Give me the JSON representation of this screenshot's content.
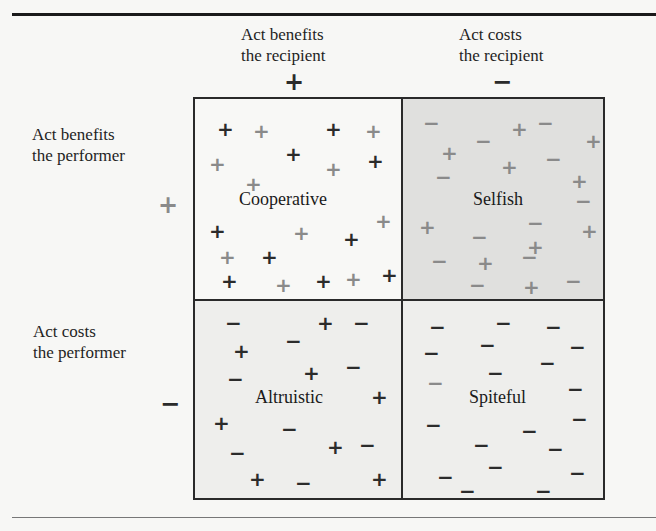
{
  "top_cut_glyph": "p",
  "column_headers": [
    {
      "line1": "Act benefits",
      "line2": "the recipient",
      "sign": "+"
    },
    {
      "line1": "Act costs",
      "line2": "the recipient",
      "sign": "−"
    }
  ],
  "row_headers": [
    {
      "line1": "Act benefits",
      "line2": "the performer",
      "sign": "+"
    },
    {
      "line1": "Act costs",
      "line2": "the performer",
      "sign": "−"
    }
  ],
  "quadrants": {
    "cooperative": {
      "label": "Cooperative",
      "background": "#f8f8f6"
    },
    "selfish": {
      "label": "Selfish",
      "background": "#e0e0de"
    },
    "altruistic": {
      "label": "Altruistic",
      "background": "#eeeeec"
    },
    "spiteful": {
      "label": "Spiteful",
      "background": "#eeeeec"
    }
  },
  "marks": {
    "cooperative": [
      {
        "s": "+",
        "x": 22,
        "y": 20,
        "c": "dark"
      },
      {
        "s": "+",
        "x": 58,
        "y": 22,
        "c": "gray"
      },
      {
        "s": "+",
        "x": 130,
        "y": 20,
        "c": "dark"
      },
      {
        "s": "+",
        "x": 170,
        "y": 22,
        "c": "gray"
      },
      {
        "s": "+",
        "x": 14,
        "y": 55,
        "c": "gray"
      },
      {
        "s": "+",
        "x": 90,
        "y": 45,
        "c": "dark"
      },
      {
        "s": "+",
        "x": 130,
        "y": 60,
        "c": "gray"
      },
      {
        "s": "+",
        "x": 172,
        "y": 52,
        "c": "dark"
      },
      {
        "s": "+",
        "x": 50,
        "y": 75,
        "c": "gray"
      },
      {
        "s": "+",
        "x": 14,
        "y": 122,
        "c": "dark"
      },
      {
        "s": "+",
        "x": 98,
        "y": 124,
        "c": "gray"
      },
      {
        "s": "+",
        "x": 148,
        "y": 130,
        "c": "dark"
      },
      {
        "s": "+",
        "x": 180,
        "y": 112,
        "c": "gray"
      },
      {
        "s": "+",
        "x": 24,
        "y": 148,
        "c": "gray"
      },
      {
        "s": "+",
        "x": 66,
        "y": 148,
        "c": "dark"
      },
      {
        "s": "+",
        "x": 26,
        "y": 172,
        "c": "dark"
      },
      {
        "s": "+",
        "x": 80,
        "y": 176,
        "c": "gray"
      },
      {
        "s": "+",
        "x": 120,
        "y": 172,
        "c": "dark"
      },
      {
        "s": "+",
        "x": 150,
        "y": 170,
        "c": "gray"
      },
      {
        "s": "+",
        "x": 186,
        "y": 166,
        "c": "dark"
      }
    ],
    "selfish": [
      {
        "s": "−",
        "x": 20,
        "y": 14,
        "c": "gray"
      },
      {
        "s": "+",
        "x": 108,
        "y": 20,
        "c": "gray"
      },
      {
        "s": "−",
        "x": 134,
        "y": 14,
        "c": "gray"
      },
      {
        "s": "+",
        "x": 182,
        "y": 32,
        "c": "gray"
      },
      {
        "s": "+",
        "x": 38,
        "y": 44,
        "c": "gray"
      },
      {
        "s": "−",
        "x": 72,
        "y": 32,
        "c": "gray"
      },
      {
        "s": "−",
        "x": 142,
        "y": 50,
        "c": "gray"
      },
      {
        "s": "+",
        "x": 98,
        "y": 58,
        "c": "gray"
      },
      {
        "s": "−",
        "x": 32,
        "y": 68,
        "c": "gray"
      },
      {
        "s": "+",
        "x": 168,
        "y": 72,
        "c": "gray"
      },
      {
        "s": "−",
        "x": 172,
        "y": 92,
        "c": "gray"
      },
      {
        "s": "+",
        "x": 16,
        "y": 118,
        "c": "gray"
      },
      {
        "s": "−",
        "x": 124,
        "y": 114,
        "c": "gray"
      },
      {
        "s": "−",
        "x": 68,
        "y": 128,
        "c": "gray"
      },
      {
        "s": "+",
        "x": 178,
        "y": 122,
        "c": "gray"
      },
      {
        "s": "+",
        "x": 124,
        "y": 138,
        "c": "gray"
      },
      {
        "s": "−",
        "x": 28,
        "y": 152,
        "c": "gray"
      },
      {
        "s": "+",
        "x": 74,
        "y": 154,
        "c": "gray"
      },
      {
        "s": "−",
        "x": 118,
        "y": 148,
        "c": "gray"
      },
      {
        "s": "−",
        "x": 66,
        "y": 176,
        "c": "gray"
      },
      {
        "s": "+",
        "x": 120,
        "y": 178,
        "c": "gray"
      },
      {
        "s": "−",
        "x": 162,
        "y": 172,
        "c": "gray"
      }
    ],
    "altruistic": [
      {
        "s": "−",
        "x": 30,
        "y": 12,
        "c": "dark"
      },
      {
        "s": "+",
        "x": 122,
        "y": 12,
        "c": "dark"
      },
      {
        "s": "−",
        "x": 158,
        "y": 12,
        "c": "dark"
      },
      {
        "s": "+",
        "x": 38,
        "y": 40,
        "c": "dark"
      },
      {
        "s": "−",
        "x": 90,
        "y": 30,
        "c": "dark"
      },
      {
        "s": "−",
        "x": 32,
        "y": 68,
        "c": "dark"
      },
      {
        "s": "+",
        "x": 108,
        "y": 62,
        "c": "dark"
      },
      {
        "s": "−",
        "x": 150,
        "y": 56,
        "c": "dark"
      },
      {
        "s": "+",
        "x": 176,
        "y": 86,
        "c": "dark"
      },
      {
        "s": "+",
        "x": 18,
        "y": 112,
        "c": "dark"
      },
      {
        "s": "−",
        "x": 86,
        "y": 118,
        "c": "dark"
      },
      {
        "s": "−",
        "x": 34,
        "y": 142,
        "c": "dark"
      },
      {
        "s": "+",
        "x": 132,
        "y": 136,
        "c": "dark"
      },
      {
        "s": "−",
        "x": 164,
        "y": 134,
        "c": "dark"
      },
      {
        "s": "+",
        "x": 54,
        "y": 168,
        "c": "dark"
      },
      {
        "s": "−",
        "x": 100,
        "y": 172,
        "c": "dark"
      },
      {
        "s": "+",
        "x": 176,
        "y": 168,
        "c": "dark"
      }
    ],
    "spiteful": [
      {
        "s": "−",
        "x": 26,
        "y": 16,
        "c": "dark"
      },
      {
        "s": "−",
        "x": 92,
        "y": 12,
        "c": "dark"
      },
      {
        "s": "−",
        "x": 142,
        "y": 16,
        "c": "dark"
      },
      {
        "s": "−",
        "x": 76,
        "y": 34,
        "c": "dark"
      },
      {
        "s": "−",
        "x": 20,
        "y": 42,
        "c": "dark"
      },
      {
        "s": "−",
        "x": 166,
        "y": 36,
        "c": "dark"
      },
      {
        "s": "−",
        "x": 136,
        "y": 52,
        "c": "dark"
      },
      {
        "s": "−",
        "x": 84,
        "y": 62,
        "c": "dark"
      },
      {
        "s": "−",
        "x": 24,
        "y": 72,
        "c": "gray"
      },
      {
        "s": "−",
        "x": 164,
        "y": 78,
        "c": "dark"
      },
      {
        "s": "−",
        "x": 22,
        "y": 114,
        "c": "dark"
      },
      {
        "s": "−",
        "x": 168,
        "y": 108,
        "c": "dark"
      },
      {
        "s": "−",
        "x": 118,
        "y": 120,
        "c": "dark"
      },
      {
        "s": "−",
        "x": 70,
        "y": 134,
        "c": "dark"
      },
      {
        "s": "−",
        "x": 144,
        "y": 138,
        "c": "dark"
      },
      {
        "s": "−",
        "x": 84,
        "y": 156,
        "c": "dark"
      },
      {
        "s": "−",
        "x": 34,
        "y": 166,
        "c": "dark"
      },
      {
        "s": "−",
        "x": 166,
        "y": 162,
        "c": "dark"
      },
      {
        "s": "−",
        "x": 56,
        "y": 180,
        "c": "dark"
      },
      {
        "s": "−",
        "x": 132,
        "y": 180,
        "c": "dark"
      }
    ]
  }
}
